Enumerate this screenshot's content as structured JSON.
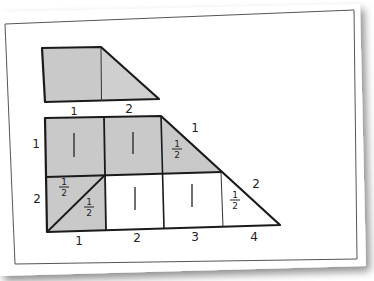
{
  "colors": {
    "shaded": "#c9c9c9",
    "stroke": "#1a1a1a",
    "paper": "#ffffff",
    "border": "#555555"
  },
  "small_shape": {
    "bottom_labels": [
      "1",
      "2"
    ]
  },
  "large_shape": {
    "left_labels": [
      "1",
      "2"
    ],
    "diagonal_labels": [
      "1",
      "2"
    ],
    "bottom_labels": [
      "1",
      "2",
      "3",
      "4"
    ],
    "cells": {
      "top_row": [
        "1",
        "1",
        "1/2"
      ],
      "bottom_row_left_upper": "1/2",
      "bottom_row_left_lower": "1/2",
      "bottom_row": [
        "1",
        "1",
        "1/2"
      ]
    }
  }
}
